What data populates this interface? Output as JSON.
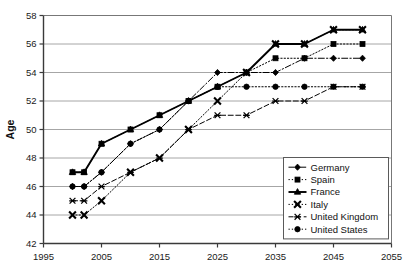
{
  "chart_data": {
    "type": "line",
    "title": "",
    "xlabel": "",
    "ylabel": "Age",
    "xlim": [
      1995,
      2055
    ],
    "ylim": [
      42,
      58
    ],
    "xticks": [
      1995,
      2005,
      2015,
      2025,
      2035,
      2045,
      2055
    ],
    "yticks": [
      42,
      44,
      46,
      48,
      50,
      52,
      54,
      56,
      58
    ],
    "grid": "horizontal",
    "legend_position": "lower-right-inside",
    "x": [
      2000,
      2002,
      2005,
      2010,
      2015,
      2020,
      2025,
      2030,
      2035,
      2040,
      2045,
      2050
    ],
    "series": [
      {
        "name": "Germany",
        "marker": "diamond",
        "linestyle": "dashdot",
        "color": "#000000",
        "values": [
          46,
          46,
          47,
          49,
          50,
          52,
          54,
          54,
          54,
          55,
          55,
          55
        ]
      },
      {
        "name": "Spain",
        "marker": "square",
        "linestyle": "dotted",
        "color": "#000000",
        "values": [
          47,
          47,
          49,
          50,
          51,
          52,
          53,
          54,
          55,
          55,
          56,
          56
        ]
      },
      {
        "name": "France",
        "marker": "triangle",
        "linestyle": "solid",
        "color": "#000000",
        "values": [
          47,
          47,
          49,
          50,
          51,
          52,
          53,
          54,
          56,
          56,
          57,
          57
        ]
      },
      {
        "name": "Italy",
        "marker": "cross",
        "linestyle": "dotted",
        "color": "#000000",
        "values": [
          44,
          44,
          45,
          47,
          48,
          50,
          52,
          54,
          56,
          56,
          57,
          57
        ]
      },
      {
        "name": "United Kingdom",
        "marker": "asterisk",
        "linestyle": "dashed",
        "color": "#000000",
        "values": [
          45,
          45,
          46,
          47,
          48,
          50,
          51,
          51,
          52,
          52,
          53,
          53
        ]
      },
      {
        "name": "United States",
        "marker": "circle",
        "linestyle": "dotted",
        "color": "#000000",
        "values": [
          46,
          46,
          47,
          49,
          50,
          52,
          53,
          53,
          53,
          53,
          53,
          53
        ]
      }
    ]
  },
  "legend": {
    "items": [
      {
        "label": "Germany"
      },
      {
        "label": "Spain"
      },
      {
        "label": "France"
      },
      {
        "label": "Italy"
      },
      {
        "label": "United Kingdom"
      },
      {
        "label": "United States"
      }
    ]
  },
  "axes": {
    "y_title": "Age",
    "x_tick_labels": [
      "1995",
      "2005",
      "2015",
      "2025",
      "2035",
      "2045",
      "2055"
    ],
    "y_tick_labels": [
      "42",
      "44",
      "46",
      "48",
      "50",
      "52",
      "54",
      "56",
      "58"
    ]
  },
  "colors": {
    "ink": "#000000",
    "grid": "#9c9c9c",
    "axis": "#555555",
    "background": "#ffffff"
  }
}
